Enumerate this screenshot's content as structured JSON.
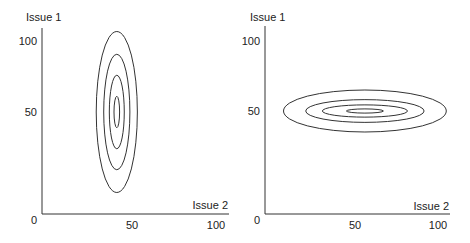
{
  "chart_data": [
    {
      "type": "contour",
      "title": "",
      "ylabel": "Issue 1",
      "xlabel": "Issue 2",
      "x_ticks": [
        "0",
        "50",
        "100"
      ],
      "y_ticks": [
        "50",
        "100"
      ],
      "xlim": [
        0,
        100
      ],
      "ylim": [
        0,
        100
      ],
      "center": {
        "x": 40,
        "y": 50
      },
      "orientation": "vertical",
      "contours": [
        {
          "half_width": 11,
          "half_height": 46
        },
        {
          "half_width": 7,
          "half_height": 33
        },
        {
          "half_width": 4,
          "half_height": 21
        },
        {
          "half_width": 1.5,
          "half_height": 9
        }
      ]
    },
    {
      "type": "contour",
      "title": "",
      "ylabel": "Issue 1",
      "xlabel": "Issue 2",
      "x_ticks": [
        "0",
        "50",
        "100"
      ],
      "y_ticks": [
        "50",
        "100"
      ],
      "xlim": [
        0,
        100
      ],
      "ylim": [
        0,
        100
      ],
      "center": {
        "x": 54,
        "y": 50
      },
      "orientation": "horizontal",
      "contours": [
        {
          "half_width": 44,
          "half_height": 12
        },
        {
          "half_width": 32,
          "half_height": 6.5
        },
        {
          "half_width": 23,
          "half_height": 3.5
        },
        {
          "half_width": 10,
          "half_height": 1.2
        }
      ]
    }
  ]
}
